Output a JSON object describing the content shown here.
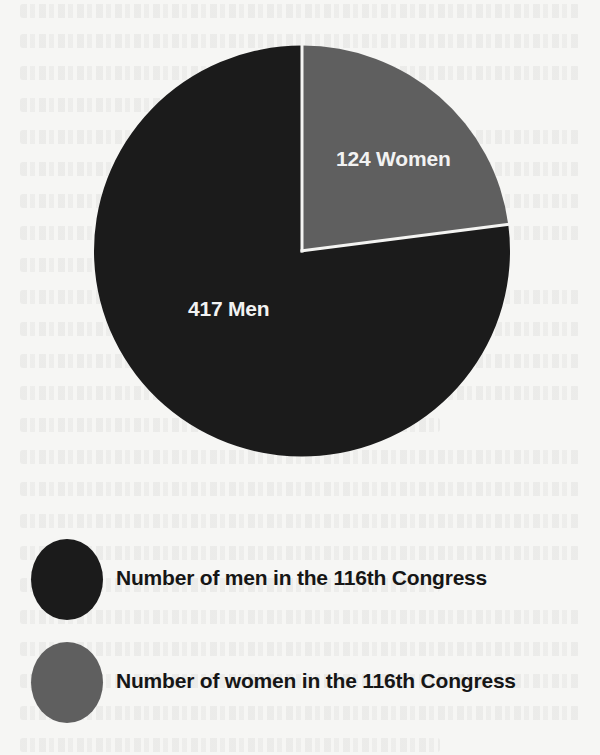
{
  "chart_data": {
    "type": "pie",
    "title": "",
    "categories": [
      "Women",
      "Men"
    ],
    "values": [
      124,
      417
    ],
    "total": 541,
    "slice_labels": [
      "124 Women",
      "417 Men"
    ],
    "legend": [
      {
        "label": "Number of men in the 116th Congress",
        "color": "#1b1b1b"
      },
      {
        "label": "Number of women in the 116th Congress",
        "color": "#5f5f5f"
      }
    ],
    "legend_position": "bottom-left",
    "start_angle_deg": 0,
    "direction": "clockwise"
  },
  "colors": {
    "men": "#1b1b1b",
    "women": "#5f5f5f",
    "separator": "#f4f4f2",
    "background": "#f6f6f4",
    "label_text": "#f2f2f2",
    "legend_text": "#161616"
  }
}
